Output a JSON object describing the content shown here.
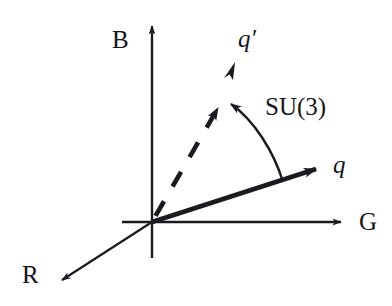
{
  "figure": {
    "type": "vector-diagram",
    "background_color": "#ffffff",
    "ink_color": "#1a1a20",
    "width": 392,
    "height": 306
  },
  "axes": {
    "origin": {
      "x": 152,
      "y": 222
    },
    "items": [
      {
        "key": "blue",
        "label": "B",
        "description": "vertical colour axis, arrow up",
        "from": {
          "x": 152,
          "y": 258
        },
        "to": {
          "x": 152,
          "y": 22
        },
        "label_pos": {
          "x": 112,
          "y": 27
        }
      },
      {
        "key": "green",
        "label": "G",
        "description": "horizontal colour axis, arrow right",
        "from": {
          "x": 122,
          "y": 222
        },
        "to": {
          "x": 345,
          "y": 222
        },
        "label_pos": {
          "x": 359,
          "y": 209
        }
      },
      {
        "key": "red",
        "label": "R",
        "description": "oblique colour axis, arrow down-left",
        "from": {
          "x": 152,
          "y": 222
        },
        "to": {
          "x": 57,
          "y": 283
        },
        "label_pos": {
          "x": 22,
          "y": 262
        }
      }
    ]
  },
  "vectors": [
    {
      "key": "q",
      "label": "q",
      "style": "solid-thick",
      "description": "original quark colour vector",
      "from": {
        "x": 152,
        "y": 222
      },
      "to": {
        "x": 325,
        "y": 166
      },
      "label_pos": {
        "x": 333,
        "y": 152
      }
    },
    {
      "key": "q-prime",
      "label": "q′",
      "style": "dashed-thick",
      "description": "rotated quark colour vector",
      "from": {
        "x": 152,
        "y": 222
      },
      "to": {
        "x": 224,
        "y": 98
      },
      "extra_arrow_head": {
        "x": 231,
        "y": 67
      },
      "label_pos": {
        "x": 238,
        "y": 26
      }
    }
  ],
  "annotations": [
    {
      "key": "su3-rotation",
      "label": "SU(3)",
      "description": "curved arrow from q to q' denoting an SU(3) colour rotation",
      "arc_from": {
        "x": 283,
        "y": 182
      },
      "arc_to": {
        "x": 224,
        "y": 98
      },
      "label_pos": {
        "x": 265,
        "y": 94
      }
    }
  ]
}
